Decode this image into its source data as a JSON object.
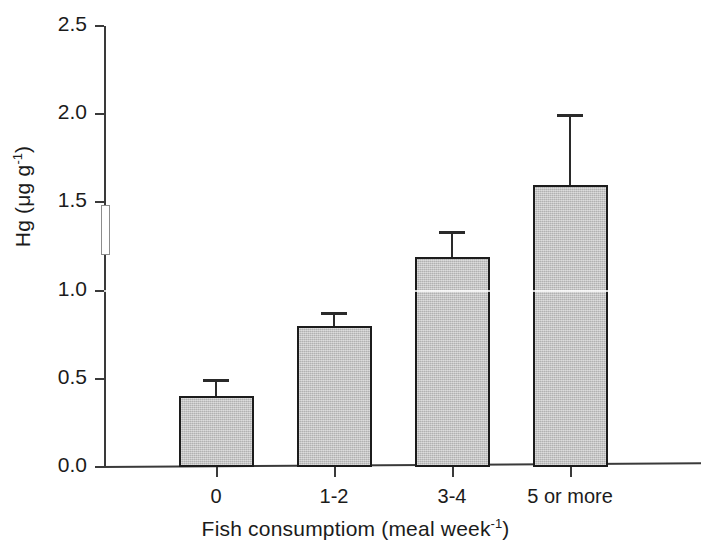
{
  "chart_data": {
    "type": "bar",
    "title": "",
    "xlabel": "Fish consumptiom (meal week-1)",
    "xlabel_main": "Fish consumptiom (meal week",
    "xlabel_sup": "-1",
    "xlabel_tail": ")",
    "ylabel": "Hg (μg g-1)",
    "ylabel_main": "Hg (μg g",
    "ylabel_sup": "-1",
    "ylabel_tail": ")",
    "categories": [
      "0",
      "1-2",
      "3-4",
      "5 or more"
    ],
    "values": [
      0.4,
      0.8,
      1.19,
      1.6
    ],
    "errors_upper": [
      0.1,
      0.08,
      0.15,
      0.4
    ],
    "error_caps": [
      0.5,
      0.88,
      1.34,
      2.0
    ],
    "ylim": [
      0.0,
      2.5
    ],
    "ytick_labels": [
      "0.0",
      "0.5",
      "1.0",
      "1.5",
      "2.0",
      "2.5"
    ],
    "ytick_values": [
      0.0,
      0.5,
      1.0,
      1.5,
      2.0,
      2.5
    ],
    "grid": false,
    "legend": "none",
    "bar_fill_color": "#c2c2c2",
    "bar_edge_color": "#1c1c1c",
    "axis_color": "#3a3a3a",
    "text_color": "#1b1b1b",
    "background_color": "#ffffff",
    "series": [
      {
        "name": "Hg concentration",
        "values": [
          0.4,
          0.8,
          1.19,
          1.6
        ]
      }
    ]
  }
}
